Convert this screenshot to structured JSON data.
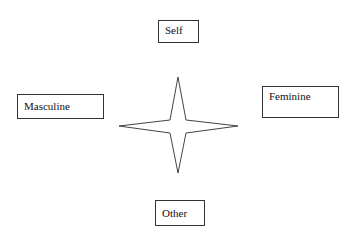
{
  "diagram": {
    "type": "concept-map",
    "nodes": [
      {
        "id": "self",
        "label": "Self",
        "position": "top"
      },
      {
        "id": "masculine",
        "label": "Masculine",
        "position": "left"
      },
      {
        "id": "feminine",
        "label": "Feminine",
        "position": "right"
      },
      {
        "id": "other",
        "label": "Other",
        "position": "bottom"
      }
    ],
    "center_shape": {
      "type": "four-point-star",
      "stroke": "#444444",
      "fill": "#ffffff"
    }
  }
}
